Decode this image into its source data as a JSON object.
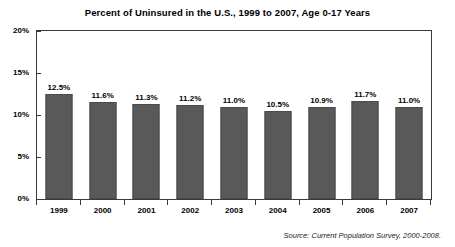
{
  "chart_data": {
    "type": "bar",
    "title": "Percent of Uninsured in the U.S., 1999 to 2007, Age 0-17 Years",
    "xlabel": "",
    "ylabel": "",
    "categories": [
      "1999",
      "2000",
      "2001",
      "2002",
      "2003",
      "2004",
      "2005",
      "2006",
      "2007"
    ],
    "values": [
      12.5,
      11.6,
      11.3,
      11.2,
      11.0,
      10.5,
      10.9,
      11.7,
      11.0
    ],
    "value_labels": [
      "12.5%",
      "11.6%",
      "11.3%",
      "11.2%",
      "11.0%",
      "10.5%",
      "10.9%",
      "11.7%",
      "11.0%"
    ],
    "ylim": [
      0,
      20
    ],
    "y_ticks": [
      0,
      5,
      10,
      15,
      20
    ],
    "y_tick_labels": [
      "0%",
      "5%",
      "10%",
      "15%",
      "20%"
    ],
    "grid": false,
    "legend": false,
    "bar_color": "#595959",
    "bar_edge_color": "#4a4a4a",
    "axis_color": "#3a3a3a",
    "background_color": "#ffffff",
    "source_note": "Source: Current Population Survey, 2000-2008."
  }
}
